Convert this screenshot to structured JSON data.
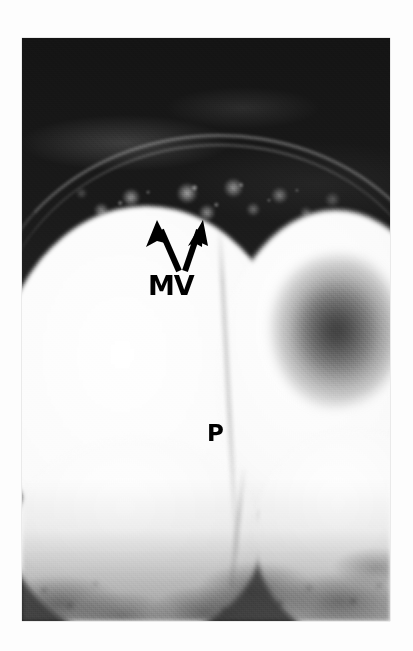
{
  "figure": {
    "kind": "electron-micrograph",
    "background_color": "#fdfdfd",
    "plate": {
      "x": 22,
      "y": 38,
      "width": 368,
      "height": 583,
      "base_color": "#151515",
      "highlight_color": "#ffffff"
    }
  },
  "labels": [
    {
      "id": "mv",
      "text": "MV",
      "meaning": "microvilli",
      "color": "#000000",
      "x": 148,
      "y": 272,
      "font_size": 27
    },
    {
      "id": "p",
      "text": "P",
      "meaning": "lipid droplet / particle",
      "color": "#000000",
      "x": 207,
      "y": 422,
      "font_size": 23
    }
  ],
  "arrows": [
    {
      "id": "arrow-left",
      "points_to": "microvilli",
      "color": "#000000",
      "tail": {
        "x": 178,
        "y": 270
      },
      "head": {
        "x": 157,
        "y": 221
      }
    },
    {
      "id": "arrow-right",
      "points_to": "microvilli",
      "color": "#000000",
      "tail": {
        "x": 182,
        "y": 270
      },
      "head": {
        "x": 198,
        "y": 221
      }
    }
  ],
  "regions": [
    {
      "id": "dark-field",
      "name": "dark extracellular field",
      "tone": "very dark"
    },
    {
      "id": "mv-band",
      "name": "microvillous brush border",
      "tone": "granular mid-grey"
    },
    {
      "id": "oval-left",
      "name": "large pale lipid droplet (left)",
      "tone": "bright white"
    },
    {
      "id": "oval-right",
      "name": "pale lipid droplet (right)",
      "tone": "bright white"
    },
    {
      "id": "dark-inclusion",
      "name": "dark diffuse inclusion",
      "tone": "mid grey"
    },
    {
      "id": "bottom-granular",
      "name": "granular cytoplasm (bottom)",
      "tone": "mottled grey"
    }
  ]
}
